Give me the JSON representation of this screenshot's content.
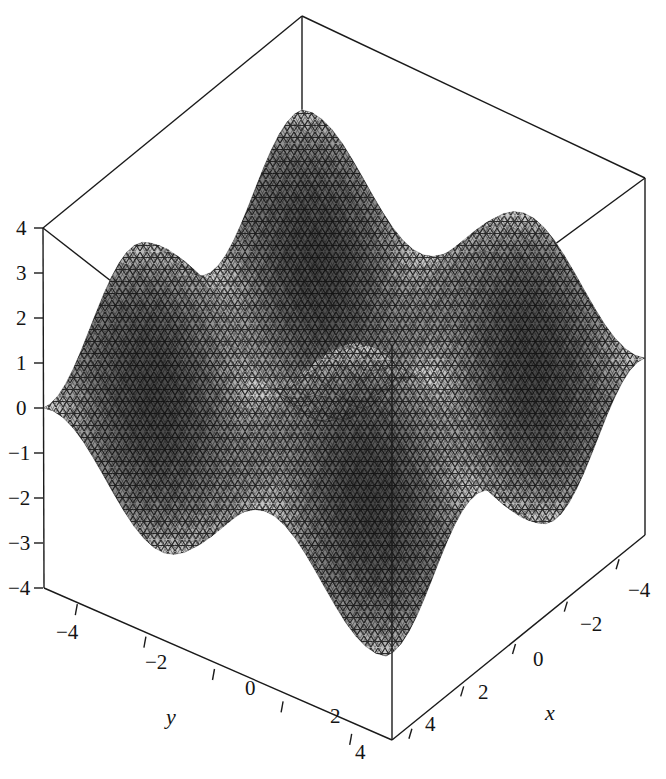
{
  "figure": {
    "title": "",
    "background_color": "#ffffff",
    "line_color": "#1a1a1a",
    "surface_dark": "#3d3d3d",
    "surface_mid": "#6e6e6e",
    "surface_light": "#a8a8a8",
    "mesh_color": "#101010"
  },
  "axes": {
    "z": {
      "label": "",
      "ticks": [
        "4",
        "3",
        "2",
        "1",
        "0",
        "−1",
        "−2",
        "−3",
        "−4"
      ],
      "values": [
        4,
        3,
        2,
        1,
        0,
        -1,
        -2,
        -3,
        -4
      ],
      "range": [
        -4,
        4
      ]
    },
    "y": {
      "label": "y",
      "ticks": [
        "−4",
        "−2",
        "0",
        "2",
        "4"
      ],
      "values": [
        -4,
        -2,
        0,
        2,
        4
      ],
      "range": [
        -5,
        5
      ]
    },
    "x": {
      "label": "x",
      "ticks": [
        "4",
        "2",
        "0",
        "−2",
        "−4"
      ],
      "values": [
        4,
        2,
        0,
        -2,
        -4
      ],
      "range": [
        -5,
        5
      ]
    }
  },
  "chart_data": {
    "type": "surface",
    "title": "",
    "xlabel": "x",
    "ylabel": "y",
    "zlabel": "",
    "xlim": [
      -5,
      5
    ],
    "ylim": [
      -5,
      5
    ],
    "zlim": [
      -4,
      4
    ],
    "grid": false,
    "legend": false,
    "projection": "3d",
    "function": "z = sin(x) + sin(y)",
    "xticks": [
      -4,
      -2,
      0,
      2,
      4
    ],
    "yticks": [
      -4,
      -2,
      0,
      2,
      4
    ],
    "zticks": [
      -4,
      -3,
      -2,
      -1,
      0,
      1,
      2,
      3,
      4
    ],
    "sample_points": [
      {
        "x": -4,
        "y": -4,
        "z": 1.51
      },
      {
        "x": -4,
        "y": -2,
        "z": -0.15
      },
      {
        "x": -4,
        "y": 0,
        "z": 0.76
      },
      {
        "x": -4,
        "y": 2,
        "z": 1.67
      },
      {
        "x": -4,
        "y": 4,
        "z": 0.0
      },
      {
        "x": -2,
        "y": -4,
        "z": -0.15
      },
      {
        "x": -2,
        "y": -2,
        "z": -1.82
      },
      {
        "x": -2,
        "y": 0,
        "z": -0.91
      },
      {
        "x": -2,
        "y": 2,
        "z": 0.0
      },
      {
        "x": -2,
        "y": 4,
        "z": -1.67
      },
      {
        "x": 0,
        "y": -4,
        "z": 0.76
      },
      {
        "x": 0,
        "y": -2,
        "z": -0.91
      },
      {
        "x": 0,
        "y": 0,
        "z": 0.0
      },
      {
        "x": 0,
        "y": 2,
        "z": 0.91
      },
      {
        "x": 0,
        "y": 4,
        "z": -0.76
      },
      {
        "x": 2,
        "y": -4,
        "z": 1.67
      },
      {
        "x": 2,
        "y": -2,
        "z": 0.0
      },
      {
        "x": 2,
        "y": 0,
        "z": 0.91
      },
      {
        "x": 2,
        "y": 2,
        "z": 1.82
      },
      {
        "x": 2,
        "y": 4,
        "z": 0.15
      },
      {
        "x": 4,
        "y": -4,
        "z": 0.0
      },
      {
        "x": 4,
        "y": -2,
        "z": -1.67
      },
      {
        "x": 4,
        "y": 0,
        "z": -0.76
      },
      {
        "x": 4,
        "y": 2,
        "z": 0.15
      },
      {
        "x": 4,
        "y": 4,
        "z": -1.51
      }
    ],
    "zmax_observed": 3.0,
    "zmin_observed": -3.5
  },
  "tick_positions": {
    "z": [
      {
        "label": "4",
        "x": 16,
        "y": 216
      },
      {
        "label": "3",
        "x": 16,
        "y": 261
      },
      {
        "label": "2",
        "x": 16,
        "y": 306
      },
      {
        "label": "1",
        "x": 16,
        "y": 351
      },
      {
        "label": "0",
        "x": 16,
        "y": 396
      },
      {
        "label": "−1",
        "x": 8,
        "y": 441
      },
      {
        "label": "−2",
        "x": 8,
        "y": 486
      },
      {
        "label": "−3",
        "x": 8,
        "y": 531
      },
      {
        "label": "−4",
        "x": 8,
        "y": 576
      }
    ],
    "y": [
      {
        "label": "−4",
        "x": 56,
        "y": 620
      },
      {
        "label": "−2",
        "x": 145,
        "y": 650
      },
      {
        "label": "0",
        "x": 245,
        "y": 676
      },
      {
        "label": "2",
        "x": 330,
        "y": 704
      },
      {
        "label": "4",
        "x": 355,
        "y": 740
      }
    ],
    "x": [
      {
        "label": "4",
        "x": 425,
        "y": 712
      },
      {
        "label": "2",
        "x": 478,
        "y": 680
      },
      {
        "label": "0",
        "x": 533,
        "y": 647
      },
      {
        "label": "−2",
        "x": 580,
        "y": 612
      },
      {
        "label": "−4",
        "x": 628,
        "y": 578
      }
    ]
  },
  "axis_title_positions": {
    "y": {
      "x": 166,
      "y": 704
    },
    "x": {
      "x": 545,
      "y": 700
    }
  }
}
